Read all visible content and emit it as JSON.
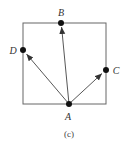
{
  "diagram": {
    "caption": "(c)",
    "colors": {
      "stroke": "#555555",
      "point": "#111111",
      "arrow": "#333333"
    },
    "square": {
      "x": 23,
      "y": 23,
      "width": 83,
      "height": 81
    },
    "points": {
      "A": {
        "label": "A",
        "x": 69,
        "y": 104
      },
      "B": {
        "label": "B",
        "x": 61,
        "y": 23
      },
      "C": {
        "label": "C",
        "x": 106,
        "y": 70
      },
      "D": {
        "label": "D",
        "x": 23,
        "y": 50
      }
    },
    "arrows": [
      {
        "from": "A",
        "to": "B"
      },
      {
        "from": "A",
        "to": "C"
      },
      {
        "from": "A",
        "to": "D"
      }
    ]
  }
}
